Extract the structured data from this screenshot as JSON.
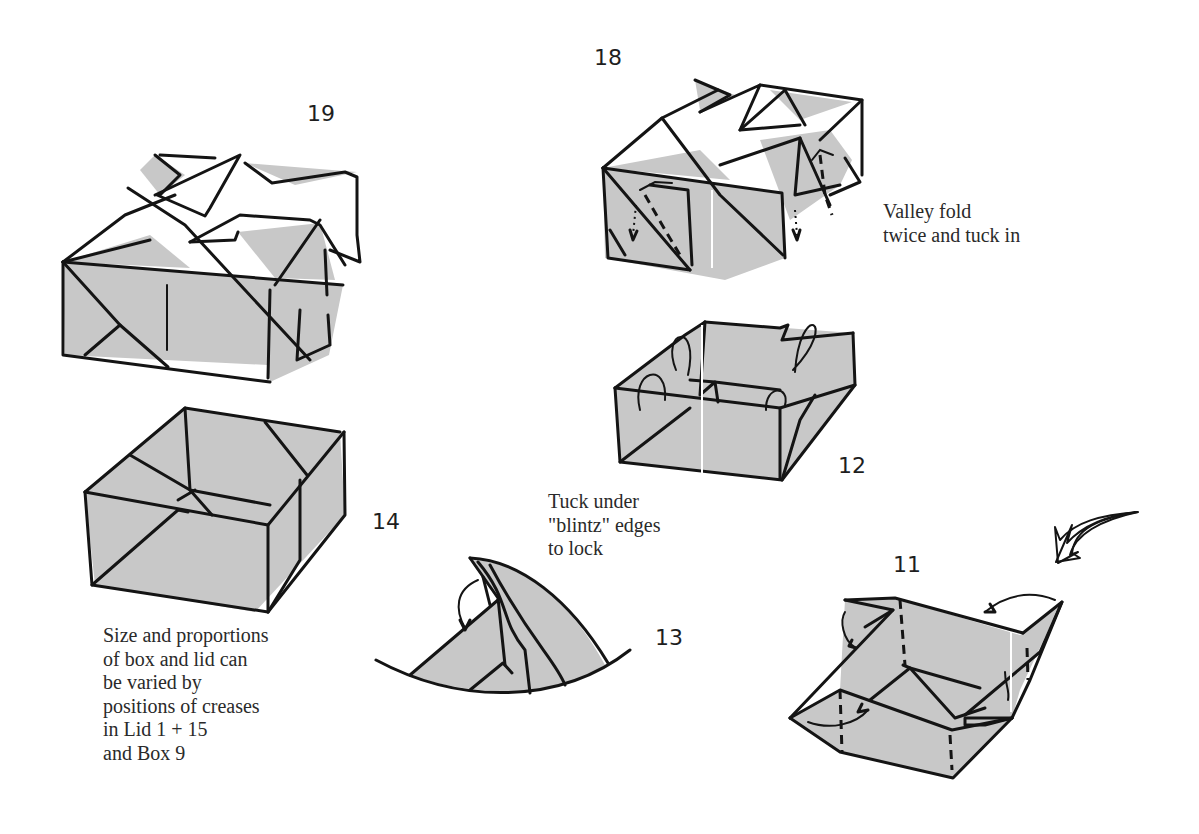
{
  "diagram": {
    "colors": {
      "paper_fill": "#c8c8c8",
      "line": "#141414",
      "background": "#ffffff"
    },
    "steps": [
      {
        "id": "19",
        "label": "19",
        "subject": "finished lid"
      },
      {
        "id": "18",
        "label": "18",
        "subject": "lid with corner flaps"
      },
      {
        "id": "12",
        "label": "12",
        "subject": "open box with flaps being folded"
      },
      {
        "id": "14",
        "label": "14",
        "subject": "finished box"
      },
      {
        "id": "13",
        "label": "13",
        "subject": "corner detail - tuck under"
      },
      {
        "id": "11",
        "label": "11",
        "subject": "box being formed"
      }
    ],
    "captions": {
      "valley_fold": "Valley fold\ntwice and tuck in",
      "tuck_under": "Tuck under\n\"blintz\" edges\nto lock",
      "size_note": "Size and proportions\nof box and lid can\nbe varied by\npositions of creases\nin Lid 1 + 15\nand Box 9"
    },
    "icons": [
      "curved-arrow-icon",
      "fold-arrow-icon",
      "dotted-arrow-icon"
    ]
  }
}
